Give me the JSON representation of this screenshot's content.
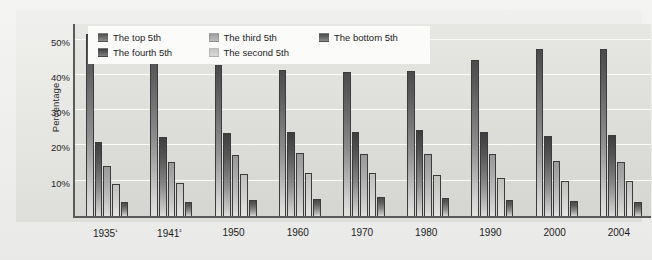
{
  "chart_data": {
    "type": "bar",
    "title": "",
    "subtitle": "",
    "xlabel": "",
    "ylabel": "Percentage",
    "ylim": [
      0,
      55
    ],
    "yticks": [
      10,
      20,
      30,
      40,
      50
    ],
    "ytick_labels": [
      "10%",
      "20%",
      "30%",
      "40%",
      "50%"
    ],
    "grid": true,
    "legend_position": "top-left",
    "categories": [
      "1935¹",
      "1941²",
      "1950",
      "1960",
      "1970",
      "1980",
      "1990",
      "2000",
      "2004"
    ],
    "category_plain": [
      "1935",
      "1941",
      "1950",
      "1960",
      "1970",
      "1980",
      "1990",
      "2000",
      "2004"
    ],
    "series": [
      {
        "name": "The top 5th",
        "values": [
          51.7,
          48.8,
          42.7,
          41.3,
          40.9,
          41.1,
          44.3,
          47.4,
          47.4
        ]
      },
      {
        "name": "The fourth 5th",
        "values": [
          20.9,
          22.3,
          23.4,
          23.8,
          23.8,
          24.4,
          23.8,
          22.7,
          22.9
        ]
      },
      {
        "name": "The third 5th",
        "values": [
          14.1,
          15.3,
          17.4,
          17.8,
          17.6,
          17.5,
          17.6,
          15.5,
          15.4
        ]
      },
      {
        "name": "The second 5th",
        "values": [
          9.2,
          9.5,
          12.0,
          12.2,
          12.2,
          11.6,
          10.8,
          9.9,
          10.0
        ]
      },
      {
        "name": "The bottom 5th",
        "values": [
          4.1,
          4.1,
          4.5,
          4.8,
          5.4,
          5.1,
          4.6,
          4.3,
          4.1
        ]
      }
    ],
    "annotations": []
  },
  "legend": {
    "entries": [
      {
        "label": "The top 5th",
        "swatch": "legend-swatch-top-fifth"
      },
      {
        "label": "The third 5th",
        "swatch": "legend-swatch-third-fifth"
      },
      {
        "label": "The bottom 5th",
        "swatch": "legend-swatch-bottom-fifth"
      },
      {
        "label": "The fourth 5th",
        "swatch": "legend-swatch-fourth-fifth"
      },
      {
        "label": "The second 5th",
        "swatch": "legend-swatch-second-fifth"
      }
    ]
  },
  "colors": {
    "plot_background": "#dcdcd9",
    "figure_background": "#eeeeec",
    "gridline": "#fbfbfa",
    "axis": "#5a5a5a",
    "legend_background": "#fbfbfa",
    "text": "#1b1b1b"
  }
}
